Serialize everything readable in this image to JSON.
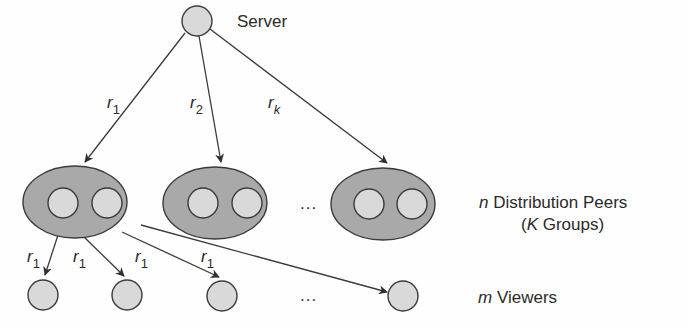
{
  "diagram": {
    "server": {
      "label": "Server",
      "cx": 197,
      "cy": 21,
      "r": 15
    },
    "groups": [
      {
        "cx": 75,
        "cy": 202,
        "rx": 52,
        "ry": 36,
        "peers": [
          {
            "cx": 63,
            "cy": 203
          },
          {
            "cx": 107,
            "cy": 203
          }
        ]
      },
      {
        "cx": 215,
        "cy": 203,
        "rx": 52,
        "ry": 36,
        "peers": [
          {
            "cx": 203,
            "cy": 203
          },
          {
            "cx": 247,
            "cy": 203
          }
        ]
      },
      {
        "cx": 383,
        "cy": 204,
        "rx": 52,
        "ry": 36,
        "peers": [
          {
            "cx": 369,
            "cy": 204
          },
          {
            "cx": 412,
            "cy": 204
          }
        ]
      }
    ],
    "groups_ellipsis": "...",
    "viewers": [
      {
        "cx": 43,
        "cy": 295
      },
      {
        "cx": 127,
        "cy": 295
      },
      {
        "cx": 222,
        "cy": 296
      },
      {
        "cx": 403,
        "cy": 296
      }
    ],
    "viewers_ellipsis": "...",
    "server_edges": [
      {
        "label_main": "r",
        "label_sub": "1",
        "x1": 185,
        "y1": 33,
        "x2": 85,
        "y2": 162,
        "lx": 107,
        "ly": 108
      },
      {
        "label_main": "r",
        "label_sub": "2",
        "x1": 199,
        "y1": 36,
        "x2": 221,
        "y2": 162,
        "lx": 190,
        "ly": 108
      },
      {
        "label_main": "r",
        "label_sub": "k",
        "x1": 210,
        "y1": 29,
        "x2": 387,
        "y2": 163,
        "lx": 268,
        "ly": 108
      }
    ],
    "viewer_edges": [
      {
        "label_main": "r",
        "label_sub": "1",
        "x1": 58,
        "y1": 235,
        "x2": 45,
        "y2": 275,
        "lx": 27,
        "ly": 262
      },
      {
        "label_main": "r",
        "label_sub": "1",
        "x1": 83,
        "y1": 236,
        "x2": 124,
        "y2": 276,
        "lx": 73,
        "ly": 262
      },
      {
        "label_main": "r",
        "label_sub": "1",
        "x1": 122,
        "y1": 232,
        "x2": 219,
        "y2": 277,
        "lx": 135,
        "ly": 262
      },
      {
        "label_main": "r",
        "label_sub": "1",
        "x1": 142,
        "y1": 224,
        "x2": 224,
        "y2": 277,
        "lx": 201,
        "ly": 262,
        "hidden_line": true
      },
      {
        "label_main": "",
        "label_sub": "",
        "x1": 141,
        "y1": 225,
        "x2": 387,
        "y2": 292
      }
    ],
    "labels": {
      "peers_var": "n",
      "peers_text": " Distribution Peers",
      "groups_open": "(",
      "groups_var": "K",
      "groups_text": " Groups)",
      "viewers_var": "m",
      "viewers_text": " Viewers"
    },
    "colors": {
      "stroke": "#3a3a3a",
      "group_fill": "#a9a9a9",
      "node_fill": "#d9d9d9",
      "text": "#2a2a2a"
    }
  }
}
